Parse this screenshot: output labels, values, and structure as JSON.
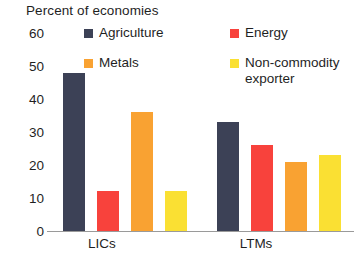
{
  "chart_data": {
    "type": "bar",
    "title": "Percent of economies",
    "xlabel": "",
    "ylabel": "",
    "ylim": [
      0,
      60
    ],
    "yticks": [
      60,
      50,
      40,
      30,
      20,
      10,
      0
    ],
    "grid": false,
    "legend_position": "top",
    "categories": [
      "LICs",
      "LTMs"
    ],
    "series": [
      {
        "name": "Agriculture",
        "color": "#3C4156",
        "values": [
          48,
          33
        ]
      },
      {
        "name": "Energy",
        "color": "#F8423C",
        "values": [
          12,
          26
        ]
      },
      {
        "name": "Metals",
        "color": "#F9A232",
        "values": [
          36,
          21
        ]
      },
      {
        "name": "Non-commodity exporter",
        "color": "#FAE033",
        "values": [
          12,
          23
        ]
      }
    ]
  },
  "axis": {
    "baseline_color": "#9a9a9a"
  }
}
